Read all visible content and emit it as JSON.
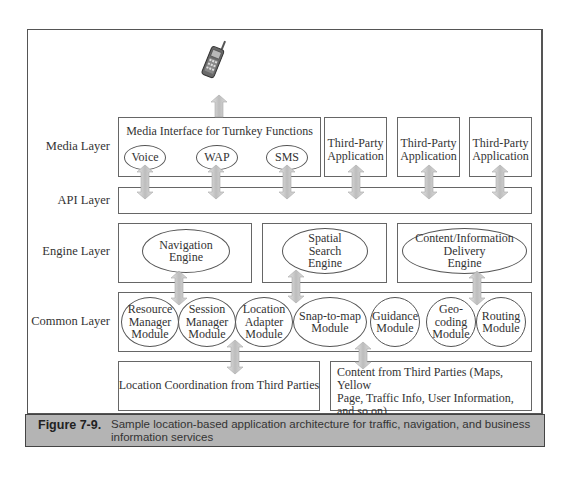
{
  "diagram": {
    "layers": [
      {
        "id": "media",
        "label": "Media Layer"
      },
      {
        "id": "api",
        "label": "API Layer"
      },
      {
        "id": "engine",
        "label": "Engine Layer"
      },
      {
        "id": "common",
        "label": "Common Layer"
      }
    ],
    "device_icon": "mobile-phone-icon",
    "media": {
      "interface_title": "Media Interface for Turnkey Functions",
      "channels": [
        "Voice",
        "WAP",
        "SMS"
      ],
      "third_party_apps": [
        {
          "line1": "Third-Party",
          "line2": "Application"
        },
        {
          "line1": "Third-Party",
          "line2": "Application"
        },
        {
          "line1": "Third-Party",
          "line2": "Application"
        }
      ]
    },
    "engines": [
      {
        "lines": [
          "Navigation",
          "Engine"
        ]
      },
      {
        "lines": [
          "Spatial",
          "Search",
          "Engine"
        ]
      },
      {
        "lines": [
          "Content/Information",
          "Delivery",
          "Engine"
        ]
      }
    ],
    "modules": [
      {
        "lines": [
          "Resource",
          "Manager",
          "Module"
        ]
      },
      {
        "lines": [
          "Session",
          "Manager",
          "Module"
        ]
      },
      {
        "lines": [
          "Location",
          "Adapter",
          "Module"
        ]
      },
      {
        "lines": [
          "Snap-to-map",
          "Module"
        ]
      },
      {
        "lines": [
          "Guidance",
          "Module"
        ]
      },
      {
        "lines": [
          "Geo-",
          "coding",
          "Module"
        ]
      },
      {
        "lines": [
          "Routing",
          "Module"
        ]
      }
    ],
    "sources": [
      {
        "text": "Location Coordination from Third Parties"
      },
      {
        "lines": [
          "Content from Third Parties (Maps, Yellow",
          "Page, Traffic Info, User Information,",
          "and so on)"
        ]
      }
    ],
    "arrow_color": "#c8c8c8"
  },
  "caption": {
    "number": "Figure 7-9.",
    "text": "Sample location-based application architecture for traffic, navigation, and business information services",
    "background": "#b4b4b4"
  }
}
